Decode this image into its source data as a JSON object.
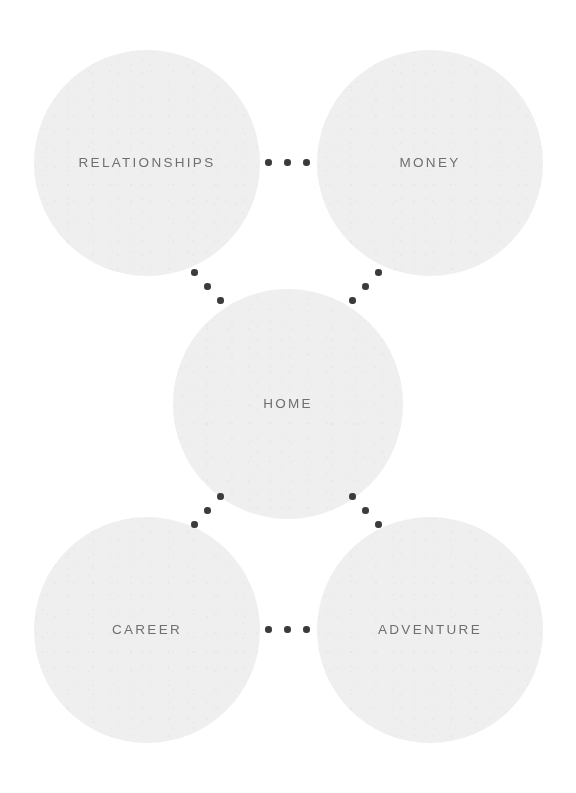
{
  "diagram": {
    "background_color": "#ffffff",
    "circle_color": "#efefef",
    "label_color": "#6f6f6f",
    "dot_color": "#3b3b3b",
    "nodes": [
      {
        "id": "relationships",
        "label": "RELATIONSHIPS",
        "position": "top-left",
        "center_x": 147,
        "center_y": 163,
        "diameter": 226
      },
      {
        "id": "money",
        "label": "MONEY",
        "position": "top-right",
        "center_x": 430,
        "center_y": 163,
        "diameter": 226
      },
      {
        "id": "home",
        "label": "HOME",
        "position": "center",
        "center_x": 288,
        "center_y": 404,
        "diameter": 230
      },
      {
        "id": "career",
        "label": "CAREER",
        "position": "bottom-left",
        "center_x": 147,
        "center_y": 630,
        "diameter": 226
      },
      {
        "id": "adventure",
        "label": "ADVENTURE",
        "position": "bottom-right",
        "center_x": 430,
        "center_y": 630,
        "diameter": 226
      }
    ],
    "connectors": [
      {
        "id": "relationships-money",
        "from": "relationships",
        "to": "money",
        "style": "horizontal",
        "dots": 3
      },
      {
        "id": "career-adventure",
        "from": "career",
        "to": "adventure",
        "style": "horizontal",
        "dots": 3
      },
      {
        "id": "relationships-home",
        "from": "relationships",
        "to": "home",
        "style": "diagonal-down",
        "dots": 3
      },
      {
        "id": "money-home",
        "from": "money",
        "to": "home",
        "style": "diagonal-up",
        "dots": 3
      },
      {
        "id": "home-career",
        "from": "home",
        "to": "career",
        "style": "diagonal-up",
        "dots": 3
      },
      {
        "id": "home-adventure",
        "from": "home",
        "to": "adventure",
        "style": "diagonal-down",
        "dots": 3
      }
    ]
  }
}
